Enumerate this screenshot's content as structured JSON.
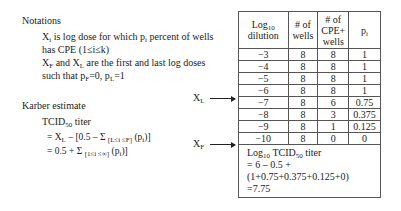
{
  "notations": {
    "heading": "Notations",
    "line1_a": "X",
    "line1_sub": "i",
    "line1_b": " is log dose for which p",
    "line1_sub2": "i",
    "line1_c": " percent of wells",
    "line2": "has CPE (1≤i≤k)",
    "line3_a": "X",
    "line3_sub": "F",
    "line3_b": " and X",
    "line3_sub2": "L",
    "line3_c": " are the first and last log doses",
    "line4_a": "such that p",
    "line4_sub": "F",
    "line4_b": "=0, p",
    "line4_sub2": "L",
    "line4_c": "=1"
  },
  "karber": {
    "heading": "Karber estimate",
    "titer_a": "TCID",
    "titer_sub": "50",
    "titer_b": " titer",
    "eq1_a": "= X",
    "eq1_sub": "L",
    "eq1_b": " – [0.5 – Σ ",
    "eq1_sub2": "[L≤i ≤F]",
    "eq1_c": " (p",
    "eq1_sub3": "i",
    "eq1_d": ")]",
    "eq2_a": "= 0.5 + Σ ",
    "eq2_sub": "[1≤i ≤∞]",
    "eq2_b": " (p",
    "eq2_sub2": "i",
    "eq2_c": ")]"
  },
  "markers": {
    "xl_a": "X",
    "xl_sub": "L",
    "xf_a": "X",
    "xf_sub": "F"
  },
  "table": {
    "headers": {
      "col1_a": "Log",
      "col1_sub": "10",
      "col1_b": "dilution",
      "col2": "# of wells",
      "col3": "# of CPE+ wells",
      "col4_a": "p",
      "col4_sub": "i"
    },
    "rows": [
      {
        "dilution": "−3",
        "wells": "8",
        "cpe": "8",
        "p": "1"
      },
      {
        "dilution": "−4",
        "wells": "8",
        "cpe": "8",
        "p": "1"
      },
      {
        "dilution": "−5",
        "wells": "8",
        "cpe": "8",
        "p": "1"
      },
      {
        "dilution": "−6",
        "wells": "8",
        "cpe": "8",
        "p": "1"
      },
      {
        "dilution": "−7",
        "wells": "8",
        "cpe": "6",
        "p": "0.75"
      },
      {
        "dilution": "−8",
        "wells": "8",
        "cpe": "3",
        "p": "0.375"
      },
      {
        "dilution": "−9",
        "wells": "8",
        "cpe": "1",
        "p": "0.125"
      },
      {
        "dilution": "−10",
        "wells": "8",
        "cpe": "0",
        "p": "0"
      }
    ],
    "footer": {
      "l1_a": "Log",
      "l1_sub": "10",
      "l1_b": " TCID",
      "l1_sub2": "50",
      "l1_c": " titer",
      "l2": "= 6 – 0.5 +",
      "l3": "(1+0.75+0.375+0.125+0)",
      "l4": "=7.75"
    }
  }
}
